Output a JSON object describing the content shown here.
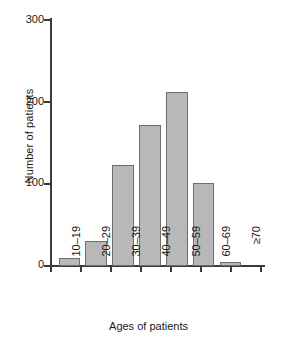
{
  "chart_data": {
    "type": "bar",
    "title": "",
    "xlabel": "Ages of patients",
    "ylabel": "Number of patients",
    "categories": [
      "10–19",
      "20–29",
      "30–39",
      "40–49",
      "50–59",
      "60–69",
      "≥70"
    ],
    "values": [
      10,
      30,
      122,
      170,
      210,
      100,
      5
    ],
    "ylim": [
      0,
      300
    ],
    "yticks": [
      0,
      100,
      200,
      300
    ],
    "ytick_labels": [
      "0",
      "100",
      "200",
      "300"
    ],
    "grid": false,
    "legend": "none",
    "bar_fill_color": "#b8b8b8",
    "bar_edge_color": "#6e6e6e",
    "axis_color": "#3b3b3b"
  }
}
